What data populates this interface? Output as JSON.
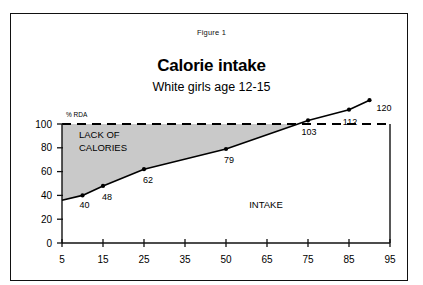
{
  "figure": {
    "label": "Figure 1"
  },
  "chart_data": {
    "type": "line",
    "title": "Calorie intake",
    "subtitle": "White girls age 12-15",
    "ylabel": "% RDA",
    "xlabel": "",
    "categories": [
      "5",
      "15",
      "25",
      "35",
      "50",
      "65",
      "75",
      "85",
      "95"
    ],
    "x_tick_labels": [
      "5",
      "15",
      "25",
      "35",
      "50",
      "65",
      "75",
      "85",
      "95"
    ],
    "y_tick_labels": [
      "0",
      "20",
      "40",
      "60",
      "80",
      "100"
    ],
    "y_ticks": [
      0,
      20,
      40,
      60,
      80,
      100
    ],
    "ylim": [
      0,
      130
    ],
    "grid": false,
    "legend": "none",
    "series": [
      {
        "name": "Calorie intake (% RDA)",
        "points": [
          {
            "x": "10",
            "value": 40,
            "label": "40"
          },
          {
            "x": "15",
            "value": 48,
            "label": "48"
          },
          {
            "x": "25",
            "value": 62,
            "label": "62"
          },
          {
            "x": "50",
            "value": 79,
            "label": "79"
          },
          {
            "x": "75",
            "value": 103,
            "label": "103"
          },
          {
            "x": "85",
            "value": 112,
            "label": "112"
          },
          {
            "x": "90",
            "value": 120,
            "label": "120"
          }
        ]
      }
    ],
    "reference_line": {
      "value": 100,
      "style": "dashed",
      "label": "100% RDA"
    },
    "annotations": [
      {
        "name": "shaded-deficit-region",
        "text": "LACK OF\nCALORIES",
        "line1": "LACK OF",
        "line2": "CALORIES"
      },
      {
        "name": "intake-region",
        "text": "INTAKE"
      }
    ],
    "colors": {
      "line": "#000000",
      "shaded_region": "#c9c9c9",
      "axis": "#111111",
      "background": "#ffffff"
    }
  }
}
